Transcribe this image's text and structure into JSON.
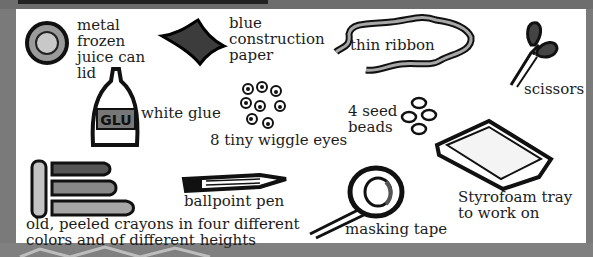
{
  "items": [
    {
      "id": "lid",
      "label": "metal\nfrozen\njuice can\nlid"
    },
    {
      "id": "paper",
      "label": "blue\nconstruction\npaper"
    },
    {
      "id": "ribbon",
      "label": "thin ribbon"
    },
    {
      "id": "scissors",
      "label": "scissors"
    },
    {
      "id": "glue",
      "label": "white glue",
      "bottle_text": "GLU"
    },
    {
      "id": "eyes",
      "label": "8 tiny wiggle eyes"
    },
    {
      "id": "beads",
      "label": "4 seed\nbeads"
    },
    {
      "id": "pen",
      "label": "ballpoint pen"
    },
    {
      "id": "crayons",
      "label": "old, peeled crayons in four different\ncolors and of different heights"
    },
    {
      "id": "tape",
      "label": "masking tape"
    },
    {
      "id": "tray",
      "label": "Styrofoam tray\nto work on"
    }
  ],
  "colors": {
    "background": "#7a7a7a",
    "panel": "#ffffff",
    "ink": "#1c1c1c"
  }
}
